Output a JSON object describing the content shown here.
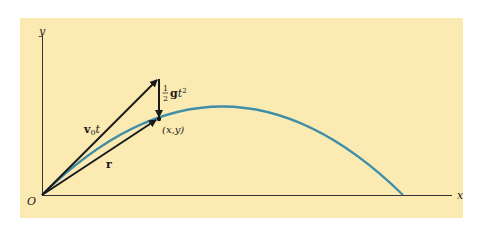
{
  "figure": {
    "background_color": "#fbeab2",
    "trajectory_color": "#3f8fa8",
    "vector_color": "#1a1a1a"
  },
  "labels": {
    "y_axis": "y",
    "x_axis": "x",
    "origin": "O",
    "v0t_vector_bold": "v",
    "v0t_vector_sub": "0",
    "v0t_vector_t": "t",
    "r_vector": "r",
    "gravity_frac_num": "1",
    "gravity_frac_den": "2",
    "gravity_g": "g",
    "gravity_t": "t",
    "gravity_exp": "2",
    "point": "(x,y)"
  }
}
